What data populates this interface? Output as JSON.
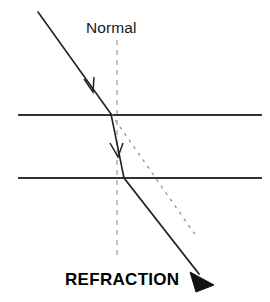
{
  "figure": {
    "type": "physics-optics-diagram",
    "topic": "refraction",
    "width": 270,
    "height": 302,
    "background_color": "#ffffff"
  },
  "labels": {
    "normal": "Normal",
    "caption": "REFRACTION"
  },
  "colors": {
    "ray": "#222222",
    "boundary": "#333333",
    "normal_dash": "#9a9a9a",
    "extension_dot": "#9a9a9a",
    "text": "#111111",
    "background": "#ffffff"
  },
  "geometry": {
    "boundaries": [
      {
        "name": "upper-boundary",
        "x1": 18,
        "y1": 115,
        "x2": 262,
        "y2": 115
      },
      {
        "name": "lower-boundary",
        "x1": 18,
        "y1": 178,
        "x2": 262,
        "y2": 178
      }
    ],
    "normal_line": {
      "x": 117,
      "y1": 40,
      "y2": 258,
      "dash": "5,5"
    },
    "incident_ray": {
      "x1": 38,
      "y1": 12,
      "x2": 111,
      "y2": 114
    },
    "internal_ray": {
      "x1": 111,
      "y1": 114,
      "x2": 124,
      "y2": 178
    },
    "emergent_ray": {
      "x1": 124,
      "y1": 178,
      "x2": 201,
      "y2": 276
    },
    "undeviated_extension": {
      "x1": 111,
      "y1": 114,
      "x2": 196,
      "y2": 236,
      "dash": "2,6"
    },
    "incident_arrow": {
      "x": 92,
      "y": 88
    },
    "internal_arrow": {
      "x": 117,
      "y": 152
    },
    "emergent_arrowhead": {
      "x": 205,
      "y": 281
    }
  }
}
